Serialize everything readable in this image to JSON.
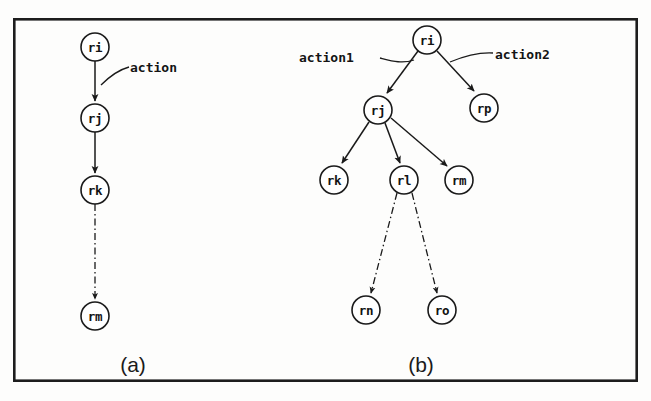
{
  "figure": {
    "title": "",
    "background_color": "#fdfdfc",
    "ink_color": "#1a1a1a",
    "frame": {
      "x": 13,
      "y": 18,
      "width": 625,
      "height": 364
    }
  },
  "panels": [
    {
      "id": "a",
      "caption": "(a)",
      "caption_pos": {
        "x": 133,
        "y": 372
      },
      "nodes": [
        {
          "id": "ri_a",
          "label": "ri",
          "cx": 95,
          "cy": 47,
          "r": 14
        },
        {
          "id": "rj_a",
          "label": "rj",
          "cx": 95,
          "cy": 118,
          "r": 14
        },
        {
          "id": "rk_a",
          "label": "rk",
          "cx": 95,
          "cy": 190,
          "r": 14
        },
        {
          "id": "rm_a",
          "label": "rm",
          "cx": 95,
          "cy": 316,
          "r": 14
        }
      ],
      "edges": [
        {
          "from": "ri_a",
          "to": "rj_a",
          "style": "solid",
          "arrow": true
        },
        {
          "from": "rj_a",
          "to": "rk_a",
          "style": "solid",
          "arrow": true
        },
        {
          "from": "rk_a",
          "to": "rm_a",
          "style": "dashdot",
          "arrow": true
        }
      ],
      "annotations": [
        {
          "id": "action_a",
          "text": "action",
          "text_x": 130,
          "text_y": 72,
          "leader": "M 108 86 C 116 78, 122 72, 130 68"
        }
      ]
    },
    {
      "id": "b",
      "caption": "(b)",
      "caption_pos": {
        "x": 421,
        "y": 372
      },
      "nodes": [
        {
          "id": "ri_b",
          "label": "ri",
          "cx": 427,
          "cy": 40,
          "r": 14
        },
        {
          "id": "rj_b",
          "label": "rj",
          "cx": 378,
          "cy": 110,
          "r": 14
        },
        {
          "id": "rp_b",
          "label": "rp",
          "cx": 484,
          "cy": 108,
          "r": 14
        },
        {
          "id": "rk_b",
          "label": "rk",
          "cx": 334,
          "cy": 180,
          "r": 14
        },
        {
          "id": "rl_b",
          "label": "rl",
          "cx": 404,
          "cy": 180,
          "r": 14
        },
        {
          "id": "rm_b",
          "label": "rm",
          "cx": 459,
          "cy": 180,
          "r": 14
        },
        {
          "id": "rn_b",
          "label": "rn",
          "cx": 366,
          "cy": 310,
          "r": 14
        },
        {
          "id": "ro_b",
          "label": "ro",
          "cx": 442,
          "cy": 310,
          "r": 14
        }
      ],
      "edges": [
        {
          "from": "ri_b",
          "to": "rj_b",
          "style": "solid",
          "arrow": true
        },
        {
          "from": "ri_b",
          "to": "rp_b",
          "style": "solid",
          "arrow": true
        },
        {
          "from": "rj_b",
          "to": "rk_b",
          "style": "solid",
          "arrow": true
        },
        {
          "from": "rj_b",
          "to": "rl_b",
          "style": "solid",
          "arrow": true
        },
        {
          "from": "rj_b",
          "to": "rm_b",
          "style": "solid",
          "arrow": true
        },
        {
          "from": "rl_b",
          "to": "rn_b",
          "style": "dashdot",
          "arrow": true
        },
        {
          "from": "rl_b",
          "to": "ro_b",
          "style": "dashdot",
          "arrow": true
        }
      ],
      "annotations": [
        {
          "id": "action1_b",
          "text": "action1",
          "text_x": 300,
          "text_y": 62,
          "leader": "M 379 60 C 360 52, 340 52, 382 57"
        },
        {
          "id": "action2_b",
          "text": "action2",
          "text_x": 495,
          "text_y": 60,
          "leader": "M 452 62 C 468 54, 480 52, 494 53"
        }
      ]
    }
  ]
}
